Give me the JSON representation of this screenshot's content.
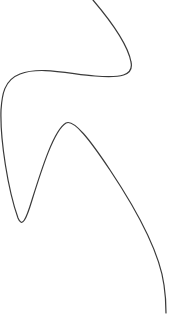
{
  "figure": {
    "width": 169,
    "height": 327,
    "background": "#ffffff",
    "stroke_color": "#3a3a3a",
    "stroke_width": 1.2
  },
  "curve": {
    "path": "M 93 0 C 110 20, 128 45, 131 62 C 134 76, 120 78, 95 76 C 70 74, 40 66, 20 74 C 4 80, 2 95, 1 110 C 0 140, 8 190, 18 218 C 22 228, 26 220, 32 200 C 42 168, 54 130, 66 123 C 74 119, 90 140, 110 170 C 140 215, 160 255, 164 285 C 166 298, 166 308, 166 313"
  }
}
